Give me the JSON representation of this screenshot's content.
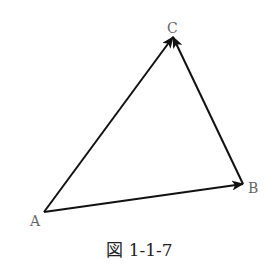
{
  "diagram": {
    "points": [
      {
        "id": "A",
        "label": "A",
        "x": 44,
        "y": 212,
        "label_x": 30,
        "label_y": 226
      },
      {
        "id": "B",
        "label": "B",
        "x": 243,
        "y": 184,
        "label_x": 248,
        "label_y": 193
      },
      {
        "id": "C",
        "label": "C",
        "x": 173,
        "y": 37,
        "label_x": 167,
        "label_y": 33
      }
    ],
    "vectors": [
      {
        "from": "A",
        "to": "B"
      },
      {
        "from": "A",
        "to": "C"
      },
      {
        "from": "B",
        "to": "C"
      }
    ],
    "caption": "図 1-1-7",
    "colors": {
      "stroke": "#111111",
      "label": "#666666"
    }
  }
}
